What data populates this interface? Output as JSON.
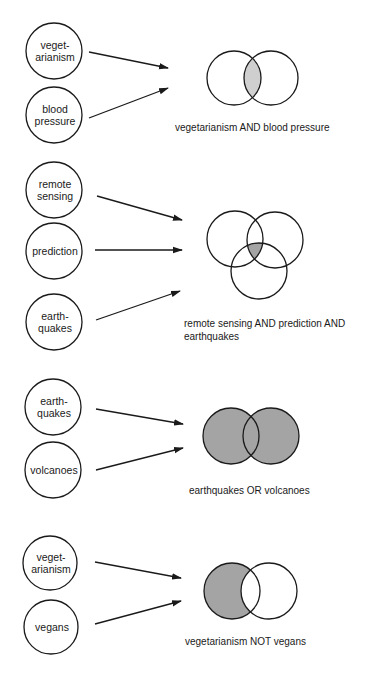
{
  "diagram": {
    "colors": {
      "stroke": "#1a1a1a",
      "fill_light": "#cfcfcf",
      "fill_dark": "#a4a4a4",
      "background": "#ffffff"
    },
    "groups": [
      {
        "id": "and-2",
        "operator": "AND",
        "terms": [
          {
            "lines": [
              "veget-",
              "arianism"
            ],
            "cx": 54,
            "cy": 51,
            "r": 28
          },
          {
            "lines": [
              "blood",
              "pressure"
            ],
            "cx": 54,
            "cy": 115,
            "r": 28
          }
        ],
        "arrows": [
          {
            "x1": 89,
            "y1": 52,
            "x2": 168,
            "y2": 68
          },
          {
            "x1": 89,
            "y1": 118,
            "x2": 168,
            "y2": 88
          }
        ],
        "venn": {
          "circles": [
            {
              "cx": 234,
              "cy": 78,
              "r": 27
            },
            {
              "cx": 271,
              "cy": 78,
              "r": 27
            }
          ],
          "shade": "intersection",
          "shade_color": "fill_light"
        },
        "label": {
          "lines": [
            "vegetarianism AND blood pressure"
          ],
          "x": 175,
          "y": 131
        }
      },
      {
        "id": "and-3",
        "operator": "AND",
        "terms": [
          {
            "lines": [
              "remote",
              "sensing"
            ],
            "cx": 54,
            "cy": 190,
            "r": 28
          },
          {
            "lines": [
              "prediction"
            ],
            "cx": 54,
            "cy": 251,
            "r": 28
          },
          {
            "lines": [
              "earth-",
              "quakes"
            ],
            "cx": 54,
            "cy": 322,
            "r": 28
          }
        ],
        "arrows": [
          {
            "x1": 97,
            "y1": 196,
            "x2": 182,
            "y2": 220
          },
          {
            "x1": 95,
            "y1": 250,
            "x2": 182,
            "y2": 250
          },
          {
            "x1": 96,
            "y1": 320,
            "x2": 180,
            "y2": 291
          }
        ],
        "venn": {
          "circles": [
            {
              "cx": 235,
              "cy": 239,
              "r": 28
            },
            {
              "cx": 275,
              "cy": 240,
              "r": 28
            },
            {
              "cx": 259,
              "cy": 271,
              "r": 28
            }
          ],
          "shade": "intersection",
          "shade_color": "fill_dark"
        },
        "label": {
          "lines": [
            "remote sensing AND prediction AND",
            "earthquakes"
          ],
          "x": 184,
          "y": 327
        }
      },
      {
        "id": "or-2",
        "operator": "OR",
        "terms": [
          {
            "lines": [
              "earth-",
              "quakes"
            ],
            "cx": 53,
            "cy": 407,
            "r": 28
          },
          {
            "lines": [
              "volcanoes"
            ],
            "cx": 53,
            "cy": 470,
            "r": 28
          }
        ],
        "arrows": [
          {
            "x1": 96,
            "y1": 409,
            "x2": 183,
            "y2": 424
          },
          {
            "x1": 96,
            "y1": 470,
            "x2": 183,
            "y2": 448
          }
        ],
        "venn": {
          "circles": [
            {
              "cx": 231,
              "cy": 436,
              "r": 28
            },
            {
              "cx": 271,
              "cy": 436,
              "r": 28
            }
          ],
          "shade": "union",
          "shade_color": "fill_dark"
        },
        "label": {
          "lines": [
            "earthquakes OR volcanoes"
          ],
          "x": 189,
          "y": 494
        }
      },
      {
        "id": "not-2",
        "operator": "NOT",
        "terms": [
          {
            "lines": [
              "veget-",
              "arianism"
            ],
            "cx": 50,
            "cy": 563,
            "r": 27
          },
          {
            "lines": [
              "vegans"
            ],
            "cx": 51,
            "cy": 627,
            "r": 27
          }
        ],
        "arrows": [
          {
            "x1": 95,
            "y1": 562,
            "x2": 181,
            "y2": 578
          },
          {
            "x1": 95,
            "y1": 624,
            "x2": 181,
            "y2": 601
          }
        ],
        "venn": {
          "circles": [
            {
              "cx": 232,
              "cy": 591,
              "r": 28
            },
            {
              "cx": 269,
              "cy": 591,
              "r": 28
            }
          ],
          "shade": "difference",
          "shade_color": "fill_dark"
        },
        "label": {
          "lines": [
            "vegetarianism NOT vegans"
          ],
          "x": 185,
          "y": 645
        }
      }
    ]
  }
}
